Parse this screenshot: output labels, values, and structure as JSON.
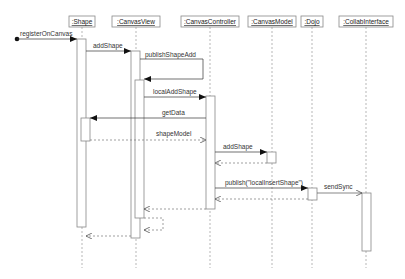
{
  "diagram": {
    "type": "sequence",
    "lifelines": [
      {
        "id": "shape",
        "label": ":Shape",
        "x": 82
      },
      {
        "id": "canvasview",
        "label": ":CanvasView",
        "x": 136
      },
      {
        "id": "canvascontroller",
        "label": ":CanvasController",
        "x": 210
      },
      {
        "id": "canvasmodel",
        "label": ":CanvasModel",
        "x": 272
      },
      {
        "id": "dojo",
        "label": ":Dojo",
        "x": 312
      },
      {
        "id": "collabinterface",
        "label": ":CollabInterface",
        "x": 366
      }
    ],
    "messages": [
      {
        "label": "registerOnCanvas",
        "from": "start",
        "to": "shape",
        "kind": "call"
      },
      {
        "label": "addShape",
        "from": "shape",
        "to": "canvasview",
        "kind": "call"
      },
      {
        "label": "publishShapeAdd",
        "from": "canvasview",
        "to": "canvasview",
        "kind": "self-call"
      },
      {
        "label": "localAddShape",
        "from": "canvasview",
        "to": "canvascontroller",
        "kind": "call"
      },
      {
        "label": "getData",
        "from": "canvascontroller",
        "to": "shape",
        "kind": "call"
      },
      {
        "label": "shapeModel",
        "from": "shape",
        "to": "canvascontroller",
        "kind": "return"
      },
      {
        "label": "addShape",
        "from": "canvascontroller",
        "to": "canvasmodel",
        "kind": "call"
      },
      {
        "label": "",
        "from": "canvasmodel",
        "to": "canvascontroller",
        "kind": "return"
      },
      {
        "label": "publish(\"localInsertShape\")",
        "from": "canvascontroller",
        "to": "dojo",
        "kind": "call"
      },
      {
        "label": "sendSync",
        "from": "dojo",
        "to": "collabinterface",
        "kind": "async"
      },
      {
        "label": "",
        "from": "dojo",
        "to": "canvascontroller",
        "kind": "return"
      },
      {
        "label": "",
        "from": "canvascontroller",
        "to": "canvasview",
        "kind": "return"
      },
      {
        "label": "",
        "from": "canvasview",
        "to": "canvasview",
        "kind": "self-return"
      },
      {
        "label": "",
        "from": "canvasview",
        "to": "shape",
        "kind": "return"
      }
    ]
  }
}
